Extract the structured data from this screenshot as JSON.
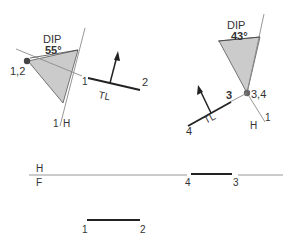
{
  "left_view": {
    "dip_label": "DIP",
    "dip_angle": "55°",
    "point_label": "1,2",
    "fold_label_top": "1",
    "fold_label_bottom": "H",
    "fold_label_one": "1",
    "tl_label": "TL",
    "end1_label": "1",
    "end2_label": "2"
  },
  "right_view": {
    "dip_label": "DIP",
    "dip_angle": "43°",
    "point_label": "3,4",
    "end3_label": "3",
    "end4_label": "4",
    "tl_label": "TL",
    "fold_label_h": "H",
    "fold_label_one": "1"
  },
  "fold_line": {
    "top_label": "H",
    "bottom_label": "F",
    "point4_label": "4",
    "point3_label": "3"
  },
  "front_segment": {
    "end1_label": "1",
    "end2_label": "2"
  },
  "colors": {
    "line": "#333333",
    "thin_line": "#8a8a8a",
    "shade": "#c8c8c8"
  }
}
